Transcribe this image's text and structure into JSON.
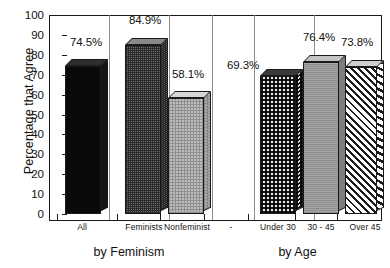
{
  "chart_data": {
    "type": "bar",
    "title": "",
    "xlabel": "",
    "ylabel": "Percentage that Agree",
    "ylim": [
      0,
      100
    ],
    "ytick_step": 10,
    "yticks": [
      "100",
      "90",
      "80",
      "70",
      "60",
      "50",
      "40",
      "30",
      "20",
      "10",
      "0"
    ],
    "grid": false,
    "legend": "none",
    "categories": [
      "All",
      "Feminists",
      "Nonfeminist",
      "-",
      "Under 30",
      "30 - 45",
      "Over 45"
    ],
    "values": [
      74.5,
      84.9,
      58.1,
      null,
      69.3,
      76.4,
      73.8
    ],
    "value_labels": [
      "74.5%",
      "84.9%",
      "58.1%",
      "",
      "69.3%",
      "76.4%",
      "73.8%"
    ],
    "groups": [
      {
        "title": "by Feminism",
        "categories": [
          "All",
          "Feminists",
          "Nonfeminist"
        ],
        "values": [
          74.5,
          84.9,
          58.1
        ]
      },
      {
        "title": "by Age",
        "categories": [
          "Under 30",
          "30 - 45",
          "Over 45"
        ],
        "values": [
          69.3,
          76.4,
          73.8
        ]
      }
    ]
  },
  "axis": {
    "y_title": "Percentage that Agree",
    "y_labels": [
      "100",
      "90",
      "80",
      "70",
      "60",
      "50",
      "40",
      "30",
      "20",
      "10",
      "0"
    ],
    "x_labels": [
      "All",
      "Feminists",
      "Nonfeminist",
      "-",
      "Under 30",
      "30 - 45",
      "Over 45"
    ]
  },
  "bars": [
    {
      "category": "All",
      "value": 74.5,
      "label": "74.5%",
      "pattern": "solid-black"
    },
    {
      "category": "Feminists",
      "value": 84.9,
      "label": "84.9%",
      "pattern": "dark-dither"
    },
    {
      "category": "Nonfeminist",
      "value": 58.1,
      "label": "58.1%",
      "pattern": "light-dither"
    },
    {
      "category": "Under 30",
      "value": 69.3,
      "label": "69.3%",
      "pattern": "checker"
    },
    {
      "category": "30 - 45",
      "value": 76.4,
      "label": "76.4%",
      "pattern": "gray"
    },
    {
      "category": "Over 45",
      "value": 73.8,
      "label": "73.8%",
      "pattern": "diagonal-hatch"
    }
  ],
  "group_titles": {
    "left": "by Feminism",
    "right": "by Age"
  },
  "colors": {
    "ink": "#111111",
    "axis": "#1a1a1a",
    "separator": "#8d8d8d",
    "background": "#ffffff"
  }
}
